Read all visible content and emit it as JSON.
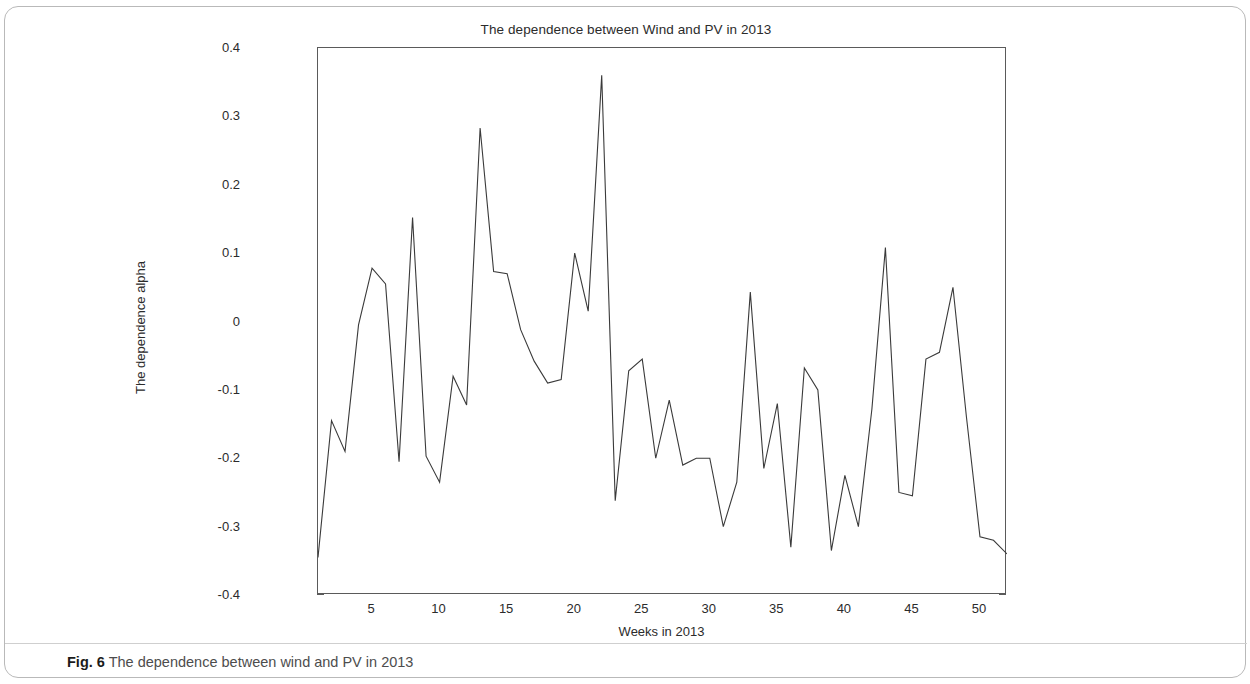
{
  "figure": {
    "caption_label": "Fig. 6",
    "caption_text": "The dependence between wind and PV in 2013"
  },
  "chart_data": {
    "type": "line",
    "title": "The dependence between Wind and PV in 2013",
    "xlabel": "Weeks in 2013",
    "ylabel": "The dependence alpha",
    "xlim": [
      1,
      52
    ],
    "ylim": [
      -0.4,
      0.4
    ],
    "grid": false,
    "legend": null,
    "xticks": [
      5,
      10,
      15,
      20,
      25,
      30,
      35,
      40,
      45,
      50
    ],
    "xtick_labels": [
      "5",
      "10",
      "15",
      "20",
      "25",
      "30",
      "35",
      "40",
      "45",
      "50"
    ],
    "yticks": [
      -0.4,
      -0.3,
      -0.2,
      -0.1,
      0,
      0.1,
      0.2,
      0.3,
      0.4
    ],
    "ytick_labels": [
      "-0.4",
      "-0.3",
      "-0.2",
      "-0.1",
      "0",
      "0.1",
      "0.2",
      "0.3",
      "0.4"
    ],
    "line_color": "#3a3a3a",
    "x": [
      1,
      2,
      3,
      4,
      5,
      6,
      7,
      8,
      9,
      10,
      11,
      12,
      13,
      14,
      15,
      16,
      17,
      18,
      19,
      20,
      21,
      22,
      23,
      24,
      25,
      26,
      27,
      28,
      29,
      30,
      31,
      32,
      33,
      34,
      35,
      36,
      37,
      38,
      39,
      40,
      41,
      42,
      43,
      44,
      45,
      46,
      47,
      48,
      49,
      50,
      51,
      52
    ],
    "values": [
      -0.345,
      -0.145,
      -0.19,
      -0.005,
      0.078,
      0.055,
      -0.205,
      0.152,
      -0.197,
      -0.235,
      -0.08,
      -0.122,
      0.283,
      0.073,
      0.07,
      -0.012,
      -0.058,
      -0.09,
      -0.085,
      0.1,
      0.015,
      0.36,
      -0.262,
      -0.072,
      -0.055,
      -0.2,
      -0.115,
      -0.21,
      -0.2,
      -0.2,
      -0.3,
      -0.235,
      0.043,
      -0.215,
      -0.12,
      -0.33,
      -0.068,
      -0.1,
      -0.335,
      -0.225,
      -0.3,
      -0.128,
      0.108,
      -0.25,
      -0.255,
      -0.055,
      -0.045,
      0.05,
      -0.14,
      -0.315,
      -0.32,
      -0.34
    ]
  }
}
